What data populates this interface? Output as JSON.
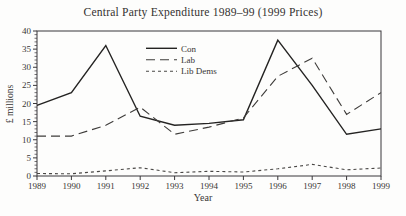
{
  "figure": {
    "background": "#fdfdfc",
    "frame_color": "#39373a",
    "text_color": "#383634"
  },
  "chart_data": {
    "type": "line",
    "title": "Central Party Expenditure 1989–99 (1999 Prices)",
    "xlabel": "Year",
    "ylabel": "£ millions",
    "x": [
      1989,
      1990,
      1991,
      1992,
      1993,
      1994,
      1995,
      1996,
      1997,
      1998,
      1999
    ],
    "ylim": [
      0,
      40
    ],
    "ytick_step": 5,
    "ytick_minor_step": 1,
    "grid": false,
    "legend_position": "inside-upper-center",
    "series": [
      {
        "name": "Con",
        "line_style": "solid",
        "color": "#242322",
        "values": [
          19.5,
          23,
          36,
          16.5,
          14,
          14.5,
          15.5,
          37.5,
          25,
          11.5,
          13
        ]
      },
      {
        "name": "Lab",
        "line_style": "long-dash",
        "color": "#3e3c3a",
        "values": [
          11,
          11,
          14,
          19,
          11.5,
          13.5,
          16,
          27.5,
          32.5,
          17,
          23
        ]
      },
      {
        "name": "Lib Dems",
        "line_style": "short-dash",
        "color": "#4a4846",
        "values": [
          0.7,
          0.6,
          1.4,
          2.3,
          0.9,
          1.3,
          1.1,
          2.0,
          3.2,
          1.7,
          2.2
        ]
      }
    ]
  }
}
